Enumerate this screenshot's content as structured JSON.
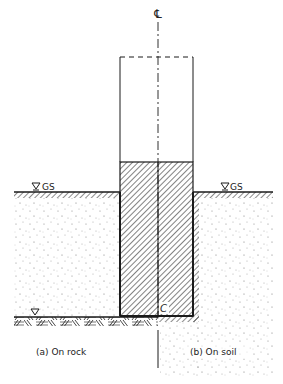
{
  "diagram": {
    "centerline_symbol": "℄",
    "ground_surface_left_label": "GS",
    "ground_surface_right_label": "GS",
    "pile_bottom_label": "C",
    "caption_left": "(a) On rock",
    "caption_right": "(b) On soil",
    "colors": {
      "line": "#1a1a1a",
      "stipple": "#8a8a8a",
      "background": "#ffffff"
    }
  }
}
